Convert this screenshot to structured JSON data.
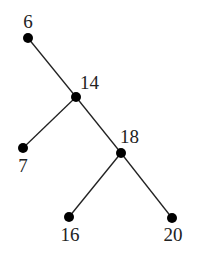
{
  "diagram": {
    "type": "binary-search-tree",
    "nodes": [
      {
        "id": "n6",
        "value": "6",
        "x": 28,
        "y": 38,
        "lx": 28,
        "ly": 28,
        "anchor": "middle"
      },
      {
        "id": "n14",
        "value": "14",
        "x": 76,
        "y": 97,
        "lx": 80,
        "ly": 89,
        "anchor": "start"
      },
      {
        "id": "n7",
        "value": "7",
        "x": 23,
        "y": 148,
        "lx": 23,
        "ly": 172,
        "anchor": "middle"
      },
      {
        "id": "n18",
        "value": "18",
        "x": 121,
        "y": 153,
        "lx": 120,
        "ly": 143,
        "anchor": "start"
      },
      {
        "id": "n16",
        "value": "16",
        "x": 69,
        "y": 217,
        "lx": 70,
        "ly": 241,
        "anchor": "middle"
      },
      {
        "id": "n20",
        "value": "20",
        "x": 172,
        "y": 218,
        "lx": 173,
        "ly": 241,
        "anchor": "middle"
      }
    ],
    "edges": [
      {
        "from": "n6",
        "to": "n14"
      },
      {
        "from": "n14",
        "to": "n7"
      },
      {
        "from": "n14",
        "to": "n18"
      },
      {
        "from": "n18",
        "to": "n16"
      },
      {
        "from": "n18",
        "to": "n20"
      }
    ],
    "colors": {
      "node": "#000000",
      "edge": "#222222",
      "background": "#ffffff"
    }
  }
}
